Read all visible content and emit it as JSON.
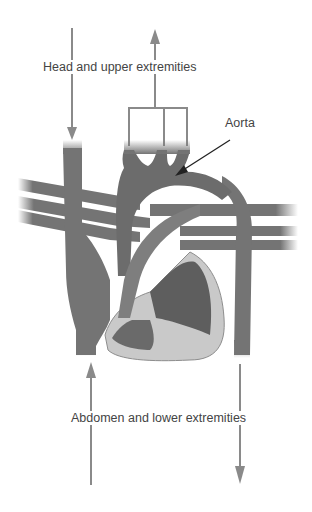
{
  "diagram": {
    "labels": {
      "head": "Head and upper extremities",
      "aorta": "Aorta",
      "abdomen": "Abdomen and lower extremities"
    },
    "colors": {
      "vessel": "#747474",
      "vessel_dark": "#5e5e5e",
      "heart_light": "#c9c9c9",
      "arrow": "#8a8a8a",
      "text": "#444444"
    }
  }
}
